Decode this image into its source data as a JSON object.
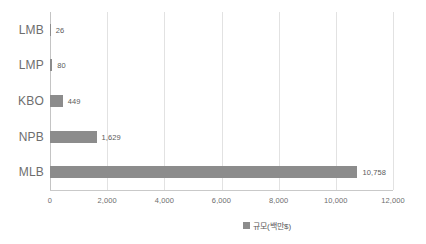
{
  "chart_data": {
    "type": "bar",
    "orientation": "horizontal",
    "title": "",
    "subtitle": "",
    "xlabel": "",
    "ylabel": "",
    "categories": [
      "LMB",
      "LMP",
      "KBO",
      "NPB",
      "MLB"
    ],
    "values": [
      26,
      80,
      449,
      1629,
      10758
    ],
    "data_labels": [
      "26",
      "80",
      "449",
      "1,629",
      "10,758"
    ],
    "xlim": [
      0,
      12000
    ],
    "xticks": [
      0,
      2000,
      4000,
      6000,
      8000,
      10000,
      12000
    ],
    "xtick_labels": [
      "0",
      "2,000",
      "4,000",
      "6,000",
      "8,000",
      "10,000",
      "12,000"
    ],
    "grid": "vertical",
    "legend_position": "bottom",
    "legend": [
      {
        "label": "규모(백만$)",
        "color": "#8c8c8c"
      }
    ],
    "series": [
      {
        "name": "규모(백만$)",
        "color": "#8c8c8c",
        "values": [
          26,
          80,
          449,
          1629,
          10758
        ]
      }
    ]
  },
  "colors": {
    "bar": "#8c8c8c",
    "gridline": "#e2e2e2",
    "axis": "#c9c9c9",
    "text": "#6e6e6e",
    "value_text": "#5b5b5b",
    "background": "#ffffff"
  }
}
